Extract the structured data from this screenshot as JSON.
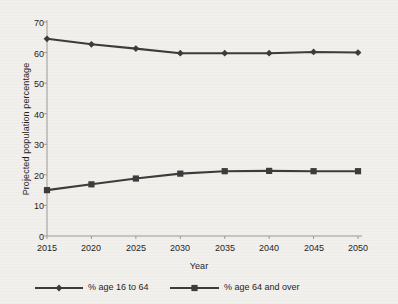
{
  "chart_data": {
    "type": "line",
    "title": "",
    "xlabel": "Year",
    "ylabel": "Projected population percentage",
    "x": [
      2015,
      2020,
      2025,
      2030,
      2035,
      2040,
      2045,
      2050
    ],
    "xtick_labels": [
      "2015",
      "2020",
      "2025",
      "2030",
      "2035",
      "2040",
      "2045",
      "2050"
    ],
    "ytick_labels": [
      "0",
      "10",
      "20",
      "30",
      "40",
      "50",
      "60",
      "70"
    ],
    "yticks": [
      0,
      10,
      20,
      30,
      40,
      50,
      60,
      70
    ],
    "ylim": [
      0,
      70
    ],
    "xlim": [
      2015,
      2050
    ],
    "grid": false,
    "legend_position": "below",
    "series": [
      {
        "name": "% age 16 to 64",
        "marker": "diamond",
        "color": "#3c3c3c",
        "values": [
          64.5,
          62.7,
          61.3,
          59.8,
          59.8,
          59.8,
          60.2,
          60.0
        ]
      },
      {
        "name": "% age 64 and over",
        "marker": "square",
        "color": "#3c3c3c",
        "values": [
          15.0,
          16.9,
          18.8,
          20.4,
          21.2,
          21.3,
          21.2,
          21.2
        ]
      }
    ]
  },
  "legend": {
    "items": [
      {
        "label": "% age 16 to 64",
        "marker": "diamond"
      },
      {
        "label": "% age 64 and over",
        "marker": "square"
      }
    ]
  },
  "colors": {
    "background": "#f2f0ed",
    "axis": "#9a9a9a",
    "line": "#3c3c3c",
    "text": "#1e1e1e"
  }
}
